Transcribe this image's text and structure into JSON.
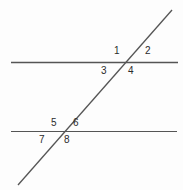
{
  "figure": {
    "background_color": "#fdfdfd",
    "line_color": "#555555",
    "label_color": "#2b2b2b",
    "width": 183,
    "height": 190
  },
  "lines": {
    "top_parallel": {
      "name": "top-parallel-line",
      "x1": 11,
      "y1": 62.5,
      "x2": 178,
      "y2": 62.5,
      "stroke_width": 1.4
    },
    "bottom_parallel": {
      "name": "bottom-parallel-line",
      "x1": 11,
      "y1": 131.5,
      "x2": 177,
      "y2": 131.5,
      "stroke_width": 1.2
    },
    "transversal": {
      "name": "transversal-line",
      "x1": 18,
      "y1": 185,
      "x2": 172,
      "y2": 10,
      "stroke_width": 1.3
    }
  },
  "intersections": [
    {
      "name": "upper-intersection",
      "x": 126,
      "y": 63
    },
    {
      "name": "lower-intersection",
      "x": 63,
      "y": 132
    }
  ],
  "angle_labels": [
    {
      "id": "1",
      "text": "1",
      "x": 114,
      "y": 46,
      "intersection": "upper",
      "position": "upper-left"
    },
    {
      "id": "2",
      "text": "2",
      "x": 145,
      "y": 46,
      "intersection": "upper",
      "position": "upper-right"
    },
    {
      "id": "3",
      "text": "3",
      "x": 101,
      "y": 66,
      "intersection": "upper",
      "position": "lower-left"
    },
    {
      "id": "4",
      "text": "4",
      "x": 128,
      "y": 66,
      "intersection": "upper",
      "position": "lower-right"
    },
    {
      "id": "5",
      "text": "5",
      "x": 51,
      "y": 118,
      "intersection": "lower",
      "position": "upper-left"
    },
    {
      "id": "6",
      "text": "6",
      "x": 73,
      "y": 118,
      "intersection": "lower",
      "position": "upper-right"
    },
    {
      "id": "7",
      "text": "7",
      "x": 39,
      "y": 135,
      "intersection": "lower",
      "position": "lower-left"
    },
    {
      "id": "8",
      "text": "8",
      "x": 64,
      "y": 135,
      "intersection": "lower",
      "position": "lower-right"
    }
  ]
}
